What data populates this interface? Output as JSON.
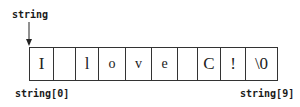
{
  "diagram": {
    "pointer_label": "string",
    "cells": [
      "I",
      "",
      "l",
      "o",
      "v",
      "e",
      "",
      "C",
      "!",
      "\\0"
    ],
    "first_index_label": "string[0]",
    "last_index_label": "string[9]"
  }
}
